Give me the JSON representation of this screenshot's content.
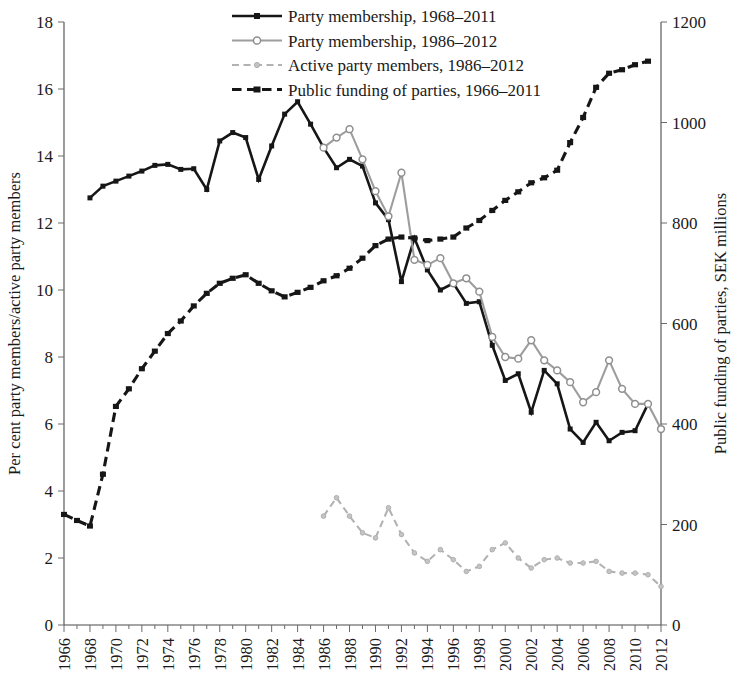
{
  "chart_data": {
    "type": "line",
    "title": "",
    "xlabel": "",
    "ylabel": "Per cent party members/active party members",
    "y2label": "Public funding of parties, SEK millions",
    "ylim": [
      0,
      18
    ],
    "ytick_step": 2,
    "y2lim": [
      0,
      1200
    ],
    "y2tick_step": 200,
    "xlim": [
      1966,
      2012
    ],
    "xtick_step": 2,
    "grid": false,
    "legend_position": "top-center",
    "yticks": [
      "0",
      "2",
      "4",
      "6",
      "8",
      "10",
      "12",
      "14",
      "16",
      "18"
    ],
    "y2ticks": [
      "0",
      "200",
      "400",
      "600",
      "800",
      "1000",
      "1200"
    ],
    "xticks": [
      "1966",
      "1968",
      "1970",
      "1972",
      "1974",
      "1976",
      "1978",
      "1980",
      "1982",
      "1984",
      "1986",
      "1988",
      "1990",
      "1992",
      "1994",
      "1996",
      "1998",
      "2000",
      "2002",
      "2004",
      "2006",
      "2008",
      "2010",
      "2012"
    ],
    "series": [
      {
        "name": "Party membership, 1968–2011",
        "key": "party_membership_1968_2011",
        "axis": "left",
        "style": "solid",
        "color": "#161616",
        "marker": "square",
        "x": [
          1968,
          1969,
          1970,
          1971,
          1972,
          1973,
          1974,
          1975,
          1976,
          1977,
          1978,
          1979,
          1980,
          1981,
          1982,
          1983,
          1984,
          1985,
          1986,
          1987,
          1988,
          1989,
          1990,
          1991,
          1992,
          1993,
          1994,
          1995,
          1996,
          1997,
          1998,
          1999,
          2000,
          2001,
          2002,
          2003,
          2004,
          2005,
          2006,
          2007,
          2008,
          2009,
          2010,
          2011
        ],
        "values": [
          12.75,
          13.1,
          13.25,
          13.4,
          13.55,
          13.72,
          13.75,
          13.6,
          13.62,
          13.0,
          14.45,
          14.7,
          14.55,
          13.3,
          14.3,
          15.25,
          15.62,
          14.95,
          14.25,
          13.65,
          13.9,
          13.7,
          12.6,
          12.1,
          10.25,
          11.55,
          10.6,
          10.0,
          10.2,
          9.6,
          9.65,
          8.35,
          7.3,
          7.5,
          6.35,
          7.6,
          7.2,
          5.85,
          5.45,
          6.05,
          5.5,
          5.75,
          5.8,
          6.6
        ]
      },
      {
        "name": "Party membership, 1986–2012",
        "key": "party_membership_1986_2012",
        "axis": "left",
        "style": "solid",
        "color": "#9d9d9d",
        "marker": "open-circle",
        "x": [
          1986,
          1987,
          1988,
          1989,
          1990,
          1991,
          1992,
          1993,
          1994,
          1995,
          1996,
          1997,
          1998,
          1999,
          2000,
          2001,
          2002,
          2003,
          2004,
          2005,
          2006,
          2007,
          2008,
          2009,
          2010,
          2011,
          2012
        ],
        "values": [
          14.25,
          14.55,
          14.8,
          13.9,
          12.95,
          12.2,
          13.5,
          10.9,
          10.75,
          10.95,
          10.2,
          10.35,
          9.95,
          8.6,
          8.0,
          7.95,
          8.5,
          7.9,
          7.6,
          7.25,
          6.65,
          6.95,
          7.9,
          7.05,
          6.6,
          6.6,
          5.85
        ]
      },
      {
        "name": "Active party members, 1986–2012",
        "key": "active_party_members_1986_2012",
        "axis": "left",
        "style": "dashed",
        "color": "#b2b2b2",
        "marker": "small-circle",
        "x": [
          1986,
          1987,
          1988,
          1989,
          1990,
          1991,
          1992,
          1993,
          1994,
          1995,
          1996,
          1997,
          1998,
          1999,
          2000,
          2001,
          2002,
          2003,
          2004,
          2005,
          2006,
          2007,
          2008,
          2009,
          2010,
          2011,
          2012
        ],
        "values": [
          3.25,
          3.8,
          3.25,
          2.75,
          2.6,
          3.5,
          2.7,
          2.15,
          1.9,
          2.25,
          1.95,
          1.6,
          1.75,
          2.25,
          2.45,
          2.0,
          1.7,
          1.95,
          2.0,
          1.85,
          1.85,
          1.9,
          1.6,
          1.55,
          1.55,
          1.5,
          1.15
        ]
      },
      {
        "name": "Public funding of parties, 1966–2011",
        "key": "public_funding_1966_2011",
        "axis": "right",
        "style": "dashed",
        "color": "#161616",
        "marker": "square",
        "x": [
          1966,
          1967,
          1968,
          1969,
          1970,
          1971,
          1972,
          1973,
          1974,
          1975,
          1976,
          1977,
          1978,
          1979,
          1980,
          1981,
          1982,
          1983,
          1984,
          1985,
          1986,
          1987,
          1988,
          1989,
          1990,
          1991,
          1992,
          1993,
          1994,
          1995,
          1996,
          1997,
          1998,
          1999,
          2000,
          2001,
          2002,
          2003,
          2004,
          2005,
          2006,
          2007,
          2008,
          2009,
          2010,
          2011
        ],
        "values": [
          220,
          208,
          197,
          300,
          435,
          470,
          510,
          545,
          580,
          605,
          635,
          660,
          680,
          690,
          697,
          680,
          665,
          653,
          662,
          672,
          685,
          695,
          710,
          730,
          755,
          768,
          772,
          770,
          765,
          768,
          772,
          790,
          805,
          825,
          845,
          862,
          880,
          890,
          905,
          960,
          1010,
          1070,
          1098,
          1105,
          1115,
          1122
        ]
      }
    ]
  },
  "legend": {
    "items": [
      {
        "label": "Party membership, 1968–2011",
        "style": "solid-black-square"
      },
      {
        "label": "Party membership, 1986–2012",
        "style": "solid-gray-circle"
      },
      {
        "label": "Active party members, 1986–2012",
        "style": "dashed-gray-circle"
      },
      {
        "label": "Public funding of parties, 1966–2011",
        "style": "dashed-black-square"
      }
    ]
  }
}
